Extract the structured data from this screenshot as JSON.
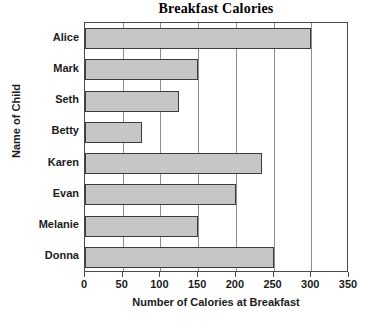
{
  "chart_data": {
    "type": "bar",
    "orientation": "horizontal",
    "title": "Breakfast Calories",
    "xlabel": "Number of Calories at Breakfast",
    "ylabel": "Name of Child",
    "categories": [
      "Alice",
      "Mark",
      "Seth",
      "Betty",
      "Karen",
      "Evan",
      "Melanie",
      "Donna"
    ],
    "values": [
      300,
      150,
      125,
      75,
      235,
      200,
      150,
      250
    ],
    "xlim": [
      0,
      350
    ],
    "xticks": [
      0,
      50,
      100,
      150,
      200,
      250,
      300,
      350
    ],
    "xtick_labels": [
      "0",
      "50",
      "100",
      "150",
      "200",
      "250",
      "300",
      "350"
    ],
    "grid": "vertical",
    "legend": null,
    "bar_fill_color": "#c6c6c6",
    "bar_border_color": "#3c3c3c",
    "grid_color": "#8d8d8d",
    "axis_color": "#4a4a4a",
    "background_color": "#ffffff"
  }
}
